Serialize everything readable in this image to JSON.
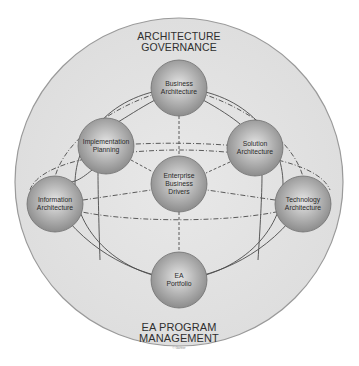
{
  "diagram": {
    "outer_ring": {
      "top_label": [
        "ARCHITECTURE",
        "GOVERNANCE"
      ],
      "bottom_label": [
        "EA PROGRAM",
        "MANAGEMENT"
      ],
      "copyright": "© Gartner",
      "fill": "#e3e3e3",
      "stroke": "#9a9a9a"
    },
    "nodes": [
      {
        "id": "business-architecture",
        "lines": [
          "Business",
          "Architecture"
        ],
        "cx": 179,
        "cy": 88
      },
      {
        "id": "implementation-planning",
        "lines": [
          "Implementation",
          "Planning"
        ],
        "cx": 106,
        "cy": 146
      },
      {
        "id": "solution-architecture",
        "lines": [
          "Solution",
          "Architecture"
        ],
        "cx": 255,
        "cy": 148
      },
      {
        "id": "enterprise-business-drivers",
        "lines": [
          "Enterprise",
          "Business",
          "Drivers"
        ],
        "cx": 179,
        "cy": 184
      },
      {
        "id": "information-architecture",
        "lines": [
          "Information",
          "Architecture"
        ],
        "cx": 55,
        "cy": 204
      },
      {
        "id": "technology-architecture",
        "lines": [
          "Technology",
          "Architecture"
        ],
        "cx": 303,
        "cy": 204
      },
      {
        "id": "ea-portfolio",
        "lines": [
          "EA",
          "Portfolio"
        ],
        "cx": 179,
        "cy": 280
      }
    ],
    "node_radius": 28,
    "node_color": "#a8a8a8",
    "line_color": "#4a4a4a"
  }
}
